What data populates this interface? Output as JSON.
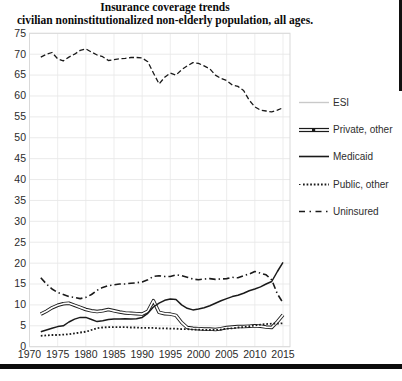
{
  "title": "Insurance coverage trends",
  "subtitle": "civilian noninstitutionalized non-elderly population, all ages.",
  "colors": {
    "line": "#1a1a1a",
    "esi_swatch": "#c9c9c9",
    "grid": "#e8e8e8",
    "border": "#d9d9d9",
    "tick_text": "#2b2b2b"
  },
  "chart_data": {
    "type": "line",
    "title": "Insurance coverage trends",
    "subtitle": "civilian noninstitutionalized non-elderly population, all ages.",
    "xlabel": "",
    "ylabel": "",
    "xlim": [
      1970,
      2016.2
    ],
    "ylim": [
      0,
      75
    ],
    "grid": true,
    "legend_position": "right",
    "xticks": [
      1970,
      1975,
      1980,
      1985,
      1990,
      1995,
      2000,
      2005,
      2010,
      2015
    ],
    "yticks": [
      0,
      5,
      10,
      15,
      20,
      25,
      30,
      35,
      40,
      45,
      50,
      55,
      60,
      65,
      70,
      75
    ],
    "x": [
      1972,
      1973,
      1974,
      1975,
      1976,
      1977,
      1978,
      1979,
      1980,
      1981,
      1982,
      1983,
      1984,
      1985,
      1986,
      1987,
      1988,
      1989,
      1990,
      1991,
      1992,
      1993,
      1994,
      1995,
      1996,
      1997,
      1998,
      1999,
      2000,
      2001,
      2002,
      2003,
      2004,
      2005,
      2006,
      2007,
      2008,
      2009,
      2010,
      2011,
      2012,
      2013,
      2014,
      2015
    ],
    "series": [
      {
        "name": "ESI",
        "style": "dashed",
        "values": [
          69.3,
          70.0,
          70.4,
          68.9,
          68.4,
          69.3,
          70.0,
          70.9,
          71.3,
          70.5,
          69.8,
          69.4,
          68.5,
          68.7,
          68.9,
          69.0,
          69.2,
          69.2,
          69.1,
          68.2,
          65.5,
          62.9,
          64.5,
          65.5,
          65.0,
          66.3,
          67.2,
          68.0,
          67.8,
          67.2,
          66.5,
          65.0,
          64.2,
          63.7,
          62.6,
          62.3,
          61.3,
          59.0,
          57.4,
          56.6,
          56.4,
          56.2,
          56.6,
          57.2
        ]
      },
      {
        "name": "Private, other",
        "style": "double-line",
        "values": [
          7.8,
          8.5,
          9.3,
          9.9,
          10.3,
          10.4,
          9.9,
          9.4,
          8.9,
          8.6,
          8.4,
          8.6,
          8.9,
          8.6,
          8.3,
          8.1,
          8.0,
          7.9,
          7.8,
          8.5,
          11.0,
          8.2,
          7.9,
          7.8,
          7.5,
          5.8,
          4.6,
          4.4,
          4.3,
          4.2,
          4.2,
          4.1,
          4.3,
          4.6,
          4.7,
          4.8,
          4.8,
          4.9,
          5.0,
          4.9,
          4.7,
          4.6,
          6.0,
          7.6
        ]
      },
      {
        "name": "Medicaid",
        "style": "solid",
        "values": [
          3.6,
          4.0,
          4.4,
          4.8,
          5.0,
          5.9,
          6.6,
          7.0,
          7.0,
          6.5,
          6.0,
          6.2,
          6.5,
          6.6,
          6.6,
          6.7,
          6.6,
          6.7,
          7.0,
          8.0,
          9.5,
          10.4,
          11.1,
          11.4,
          11.3,
          10.0,
          9.2,
          8.8,
          9.0,
          9.3,
          9.8,
          10.4,
          11.0,
          11.5,
          12.0,
          12.3,
          12.8,
          13.4,
          13.8,
          14.3,
          15.0,
          15.6,
          18.0,
          20.2
        ]
      },
      {
        "name": "Public, other",
        "style": "dotted",
        "values": [
          2.6,
          2.7,
          2.8,
          2.8,
          2.9,
          3.0,
          3.2,
          3.4,
          3.6,
          4.0,
          4.4,
          4.6,
          4.7,
          4.7,
          4.7,
          4.7,
          4.6,
          4.6,
          4.5,
          4.5,
          4.5,
          4.4,
          4.4,
          4.3,
          4.3,
          4.2,
          4.2,
          4.1,
          4.1,
          4.0,
          4.0,
          4.0,
          4.1,
          4.3,
          4.4,
          4.6,
          4.7,
          4.9,
          5.1,
          5.3,
          5.4,
          5.5,
          5.5,
          5.6
        ]
      },
      {
        "name": "Uninsured",
        "style": "dash-dot",
        "values": [
          16.5,
          15.0,
          13.8,
          13.0,
          12.5,
          12.0,
          11.8,
          11.5,
          11.8,
          12.5,
          13.5,
          14.2,
          14.6,
          14.8,
          15.0,
          15.0,
          15.2,
          15.3,
          15.5,
          16.0,
          16.8,
          17.0,
          16.8,
          16.8,
          17.2,
          17.0,
          16.6,
          16.2,
          16.0,
          16.2,
          16.3,
          16.1,
          16.2,
          16.3,
          16.6,
          16.5,
          17.0,
          17.4,
          18.0,
          17.6,
          17.2,
          16.0,
          12.6,
          10.5
        ]
      }
    ]
  }
}
